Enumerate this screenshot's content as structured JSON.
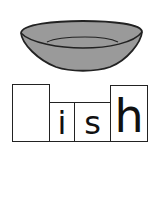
{
  "picture": {
    "subject": "dish-icon",
    "fill_color": "#9a9a9a",
    "outline_color": "#222222"
  },
  "word_boxes": [
    {
      "letter": "",
      "type": "tall"
    },
    {
      "letter": "i",
      "type": "short"
    },
    {
      "letter": "s",
      "type": "short"
    },
    {
      "letter": "h",
      "type": "tall"
    }
  ]
}
